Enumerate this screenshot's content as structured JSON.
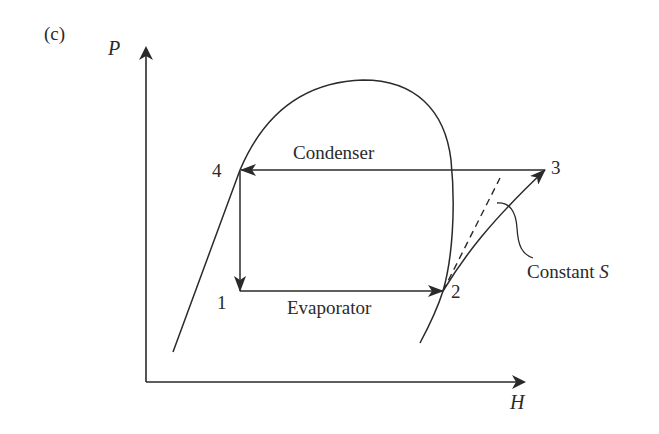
{
  "figure": {
    "panel_label": "(c)",
    "axes": {
      "y_label": "P",
      "x_label": "H"
    },
    "points": [
      {
        "id": "1",
        "label": "1",
        "description": "evaporator inlet, after expansion"
      },
      {
        "id": "2",
        "label": "2",
        "description": "saturated vapor, compressor inlet"
      },
      {
        "id": "3",
        "label": "3",
        "description": "superheated vapor, compressor outlet"
      },
      {
        "id": "4",
        "label": "4",
        "description": "saturated liquid, condenser outlet"
      }
    ],
    "processes": {
      "condenser": "Condenser",
      "evaporator": "Evaporator",
      "compression_note": "Constant S"
    },
    "constant_s_label": {
      "text": "Constant ",
      "variable": "S"
    },
    "colors": {
      "line": "#2a2a2a",
      "background": "#ffffff"
    }
  }
}
